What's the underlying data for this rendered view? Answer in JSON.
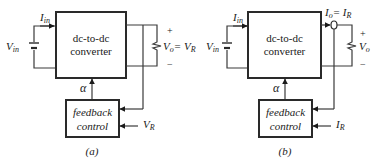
{
  "diagrams": [
    {
      "id": "a",
      "caption": "(a)",
      "converter_label_line1": "dc-to-dc",
      "converter_label_line2": "converter",
      "feedback_label_line1": "feedback",
      "feedback_label_line2": "control",
      "input_current": "I",
      "input_current_sub": "in",
      "input_voltage": "V",
      "input_voltage_sub": "in",
      "control_signal": "α",
      "output_label": "V",
      "output_label_sub": "o",
      "output_eq": "= V",
      "output_eq_sub": "R",
      "reference": "V",
      "reference_sub": "R",
      "plus": "+",
      "minus": "−"
    },
    {
      "id": "b",
      "caption": "(b)",
      "converter_label_line1": "dc-to-dc",
      "converter_label_line2": "converter",
      "feedback_label_line1": "feedback",
      "feedback_label_line2": "control",
      "input_current": "I",
      "input_current_sub": "in",
      "input_voltage": "V",
      "input_voltage_sub": "in",
      "control_signal": "α",
      "output_current": "I",
      "output_current_sub": "o",
      "output_eq": "= I",
      "output_eq_sub": "R",
      "output_voltage": "V",
      "output_voltage_sub": "o",
      "reference": "I",
      "reference_sub": "R",
      "plus": "+",
      "minus": "−"
    }
  ],
  "colors": {
    "line": "#3a3a3a",
    "text": "#1a1a1a",
    "background": "#ffffff"
  }
}
